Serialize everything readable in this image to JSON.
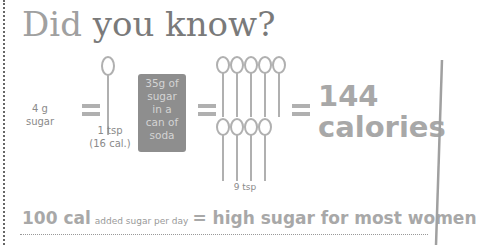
{
  "title": {
    "part1": "Did",
    "part2": " you know?"
  },
  "equation": {
    "sugar_label_line1": "4 g",
    "sugar_label_line2": "sugar",
    "spoon_label_line1": "1 tsp",
    "spoon_label_line2": "(16 cal.)",
    "soda_box_lines": [
      "35g of",
      "sugar",
      "in a",
      "can of",
      "soda"
    ],
    "nine_tsp_label": "9 tsp",
    "calories_number": "144",
    "calories_word": "calories"
  },
  "bottom": {
    "amount": "100 cal",
    "detail": "added sugar per day",
    "conclusion": "= high sugar for most women"
  },
  "icons": {
    "spoon": "teaspoon-icon",
    "equals": "equals-icon"
  },
  "colors": {
    "text_gray": "#a8a8a8",
    "box_gray": "#8e8e8e",
    "title_gray": "#7a7a7a"
  }
}
